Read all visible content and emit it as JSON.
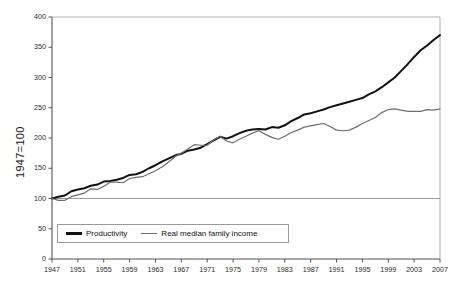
{
  "chart_data": {
    "type": "line",
    "title": "",
    "xlabel": "",
    "ylabel": "1947=100",
    "xlim": [
      1947,
      2007
    ],
    "ylim": [
      0,
      400
    ],
    "grid": "horizontal line at 100 only",
    "legend_position": "inside-bottom-left",
    "xticks": [
      "1947",
      "1951",
      "1955",
      "1959",
      "1963",
      "1967",
      "1971",
      "1975",
      "1979",
      "1983",
      "1987",
      "1991",
      "1995",
      "1999",
      "2003",
      "2007"
    ],
    "yticks": [
      "0",
      "50",
      "100",
      "150",
      "200",
      "250",
      "300",
      "350",
      "400"
    ],
    "x": [
      1947,
      1948,
      1949,
      1950,
      1951,
      1952,
      1953,
      1954,
      1955,
      1956,
      1957,
      1958,
      1959,
      1960,
      1961,
      1962,
      1963,
      1964,
      1965,
      1966,
      1967,
      1968,
      1969,
      1970,
      1971,
      1972,
      1973,
      1974,
      1975,
      1976,
      1977,
      1978,
      1979,
      1980,
      1981,
      1982,
      1983,
      1984,
      1985,
      1986,
      1987,
      1988,
      1989,
      1990,
      1991,
      1992,
      1993,
      1994,
      1995,
      1996,
      1997,
      1998,
      1999,
      2000,
      2001,
      2002,
      2003,
      2004,
      2005,
      2006,
      2007
    ],
    "series": [
      {
        "name": "Productivity",
        "color": "#111111",
        "width": 2.0,
        "values": [
          100,
          103,
          105,
          112,
          115,
          117,
          121,
          123,
          128,
          129,
          131,
          134,
          139,
          140,
          144,
          150,
          155,
          161,
          166,
          171,
          174,
          179,
          181,
          184,
          190,
          196,
          202,
          199,
          203,
          208,
          212,
          214,
          215,
          214,
          218,
          217,
          221,
          228,
          233,
          239,
          241,
          244,
          247,
          251,
          254,
          257,
          260,
          263,
          266,
          272,
          277,
          284,
          292,
          300,
          311,
          322,
          334,
          345,
          353,
          362,
          370
        ]
      },
      {
        "name": "Real median family income",
        "color": "#6e6e6e",
        "width": 1.2,
        "values": [
          100,
          97,
          97,
          103,
          106,
          109,
          116,
          115,
          120,
          127,
          127,
          126,
          133,
          135,
          136,
          141,
          146,
          152,
          160,
          169,
          175,
          182,
          189,
          188,
          188,
          197,
          203,
          195,
          192,
          198,
          203,
          208,
          212,
          206,
          201,
          198,
          203,
          209,
          213,
          218,
          220,
          222,
          224,
          219,
          213,
          212,
          213,
          218,
          224,
          229,
          234,
          242,
          247,
          248,
          246,
          244,
          244,
          244,
          247,
          246,
          248
        ]
      }
    ],
    "reference_line": {
      "value": 100,
      "orientation": "horizontal",
      "color": "#8c8c8c"
    }
  }
}
